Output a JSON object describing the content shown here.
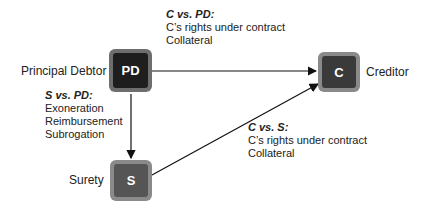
{
  "nodes": {
    "pd": {
      "abbr": "PD",
      "label": "Principal Debtor"
    },
    "c": {
      "abbr": "C",
      "label": "Creditor"
    },
    "s": {
      "abbr": "S",
      "label": "Surety"
    }
  },
  "edges": {
    "c_pd": {
      "heading": "C vs. PD:",
      "lines": [
        "C’s rights under contract",
        "Collateral"
      ]
    },
    "s_pd": {
      "heading": "S vs. PD:",
      "lines": [
        "Exoneration",
        "Reimbursement",
        "Subrogation"
      ]
    },
    "c_s": {
      "heading": "C vs. S:",
      "lines": [
        "C’s rights under contract",
        "Collateral"
      ]
    }
  },
  "colors": {
    "pd_box": "#1e1e1e",
    "c_box": "#3a3a3a",
    "s_box": "#555555",
    "frame": "#7a7a7a"
  }
}
